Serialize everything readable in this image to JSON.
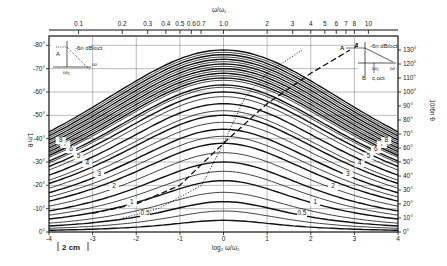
{
  "chart_data": {
    "type": "line",
    "title": "",
    "top_axis": {
      "label": "ω/ω₁",
      "scale": "log",
      "ticks": [
        "0.1",
        "0.2",
        "0.3",
        "0.4",
        "0.5",
        "0.6",
        "0.7",
        "1.0",
        "2",
        "3",
        "4",
        "5",
        "6",
        "7",
        "8",
        "10"
      ],
      "tick_values": [
        0.1,
        0.2,
        0.3,
        0.4,
        0.5,
        0.6,
        0.7,
        1.0,
        2,
        3,
        4,
        5,
        6,
        7,
        8,
        10
      ]
    },
    "bottom_axis": {
      "label": "log₂ ω/ω₁",
      "ticks": [
        "-4",
        "-3",
        "-2",
        "-1",
        "0",
        "1",
        "2",
        "3",
        "4"
      ],
      "range": [
        -4,
        4
      ]
    },
    "left_axis": {
      "label": "1/n θ",
      "ticks": [
        "0°",
        "10°",
        "20°",
        "30°",
        "40°",
        "50°",
        "60°",
        "70°",
        "80°"
      ],
      "range": [
        0,
        80
      ]
    },
    "right_axis": {
      "label": "10/6n θ",
      "ticks": [
        "0°",
        "10°",
        "20°",
        "30°",
        "40°",
        "50°",
        "60°",
        "70°",
        "80°",
        "90°",
        "100°",
        "110°",
        "120°",
        "130°"
      ],
      "range": [
        0,
        133.3
      ]
    },
    "grid": true,
    "scale_bar": "2 cm",
    "series_labels": [
      "0.5",
      "1",
      "2",
      "3",
      "4",
      "5",
      "6",
      "7",
      "8"
    ],
    "series": [
      {
        "name": "0.5",
        "peak": 13
      },
      {
        "name": "1",
        "peak": 22
      },
      {
        "name": "2",
        "peak": 34
      },
      {
        "name": "3",
        "peak": 44
      },
      {
        "name": "4",
        "peak": 52
      },
      {
        "name": "5",
        "peak": 58
      },
      {
        "name": "6",
        "peak": 63
      },
      {
        "name": "7",
        "peak": 67
      },
      {
        "name": "8",
        "peak": 70
      }
    ],
    "family_peaks": [
      5,
      9,
      13,
      17,
      22,
      26,
      30,
      34,
      38,
      41,
      44,
      47,
      50,
      52,
      55,
      58,
      60,
      62,
      63,
      65,
      66,
      67,
      68,
      69,
      70,
      71,
      72,
      73,
      74,
      75,
      76,
      77,
      78
    ],
    "family_width_sigma": 1.5,
    "curve_A": {
      "name": "A",
      "style": "dashed",
      "points": [
        [
          -3,
          8
        ],
        [
          -2,
          12
        ],
        [
          -1,
          20
        ],
        [
          0,
          38
        ],
        [
          1,
          55
        ],
        [
          2,
          68
        ],
        [
          2.9,
          78
        ]
      ]
    },
    "curve_B": {
      "name": "B",
      "style": "dotted",
      "points": [
        [
          -2.3,
          6
        ],
        [
          -1.5,
          10
        ],
        [
          -0.5,
          20
        ],
        [
          0,
          38
        ],
        [
          0.5,
          58
        ],
        [
          1,
          68
        ],
        [
          1.8,
          78
        ]
      ]
    },
    "inset_left": {
      "label_A": "A",
      "slope": "-6n dB/oct",
      "omega": "ω",
      "omega1": "ω₁"
    },
    "inset_right": {
      "label_A": "A",
      "label_B": "B",
      "slope": "-6n dB/oct",
      "omega": "ω",
      "omega1": "ω₁",
      "c_oct": "c,oct"
    }
  }
}
